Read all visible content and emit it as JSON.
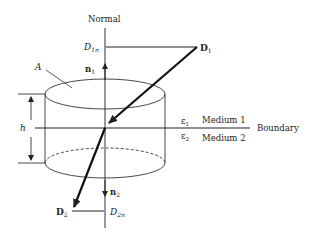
{
  "diagram": {
    "labels": {
      "normal": "Normal",
      "boundary": "Boundary",
      "medium1": "Medium 1",
      "medium2": "Medium 2",
      "eps1": "ε",
      "eps1_sub": "1",
      "eps2": "ε",
      "eps2_sub": "2",
      "area": "A",
      "height": "h",
      "n1": "n",
      "n1_sub": "1",
      "n2": "n",
      "n2_sub": "2",
      "D1": "D",
      "D1_sub": "1",
      "D2": "D",
      "D2_sub": "2",
      "D1n": "D",
      "D1n_sub": "1n",
      "D2n": "D",
      "D2n_sub": "2n"
    },
    "colors": {
      "line": "#222222",
      "background": "#ffffff"
    }
  }
}
